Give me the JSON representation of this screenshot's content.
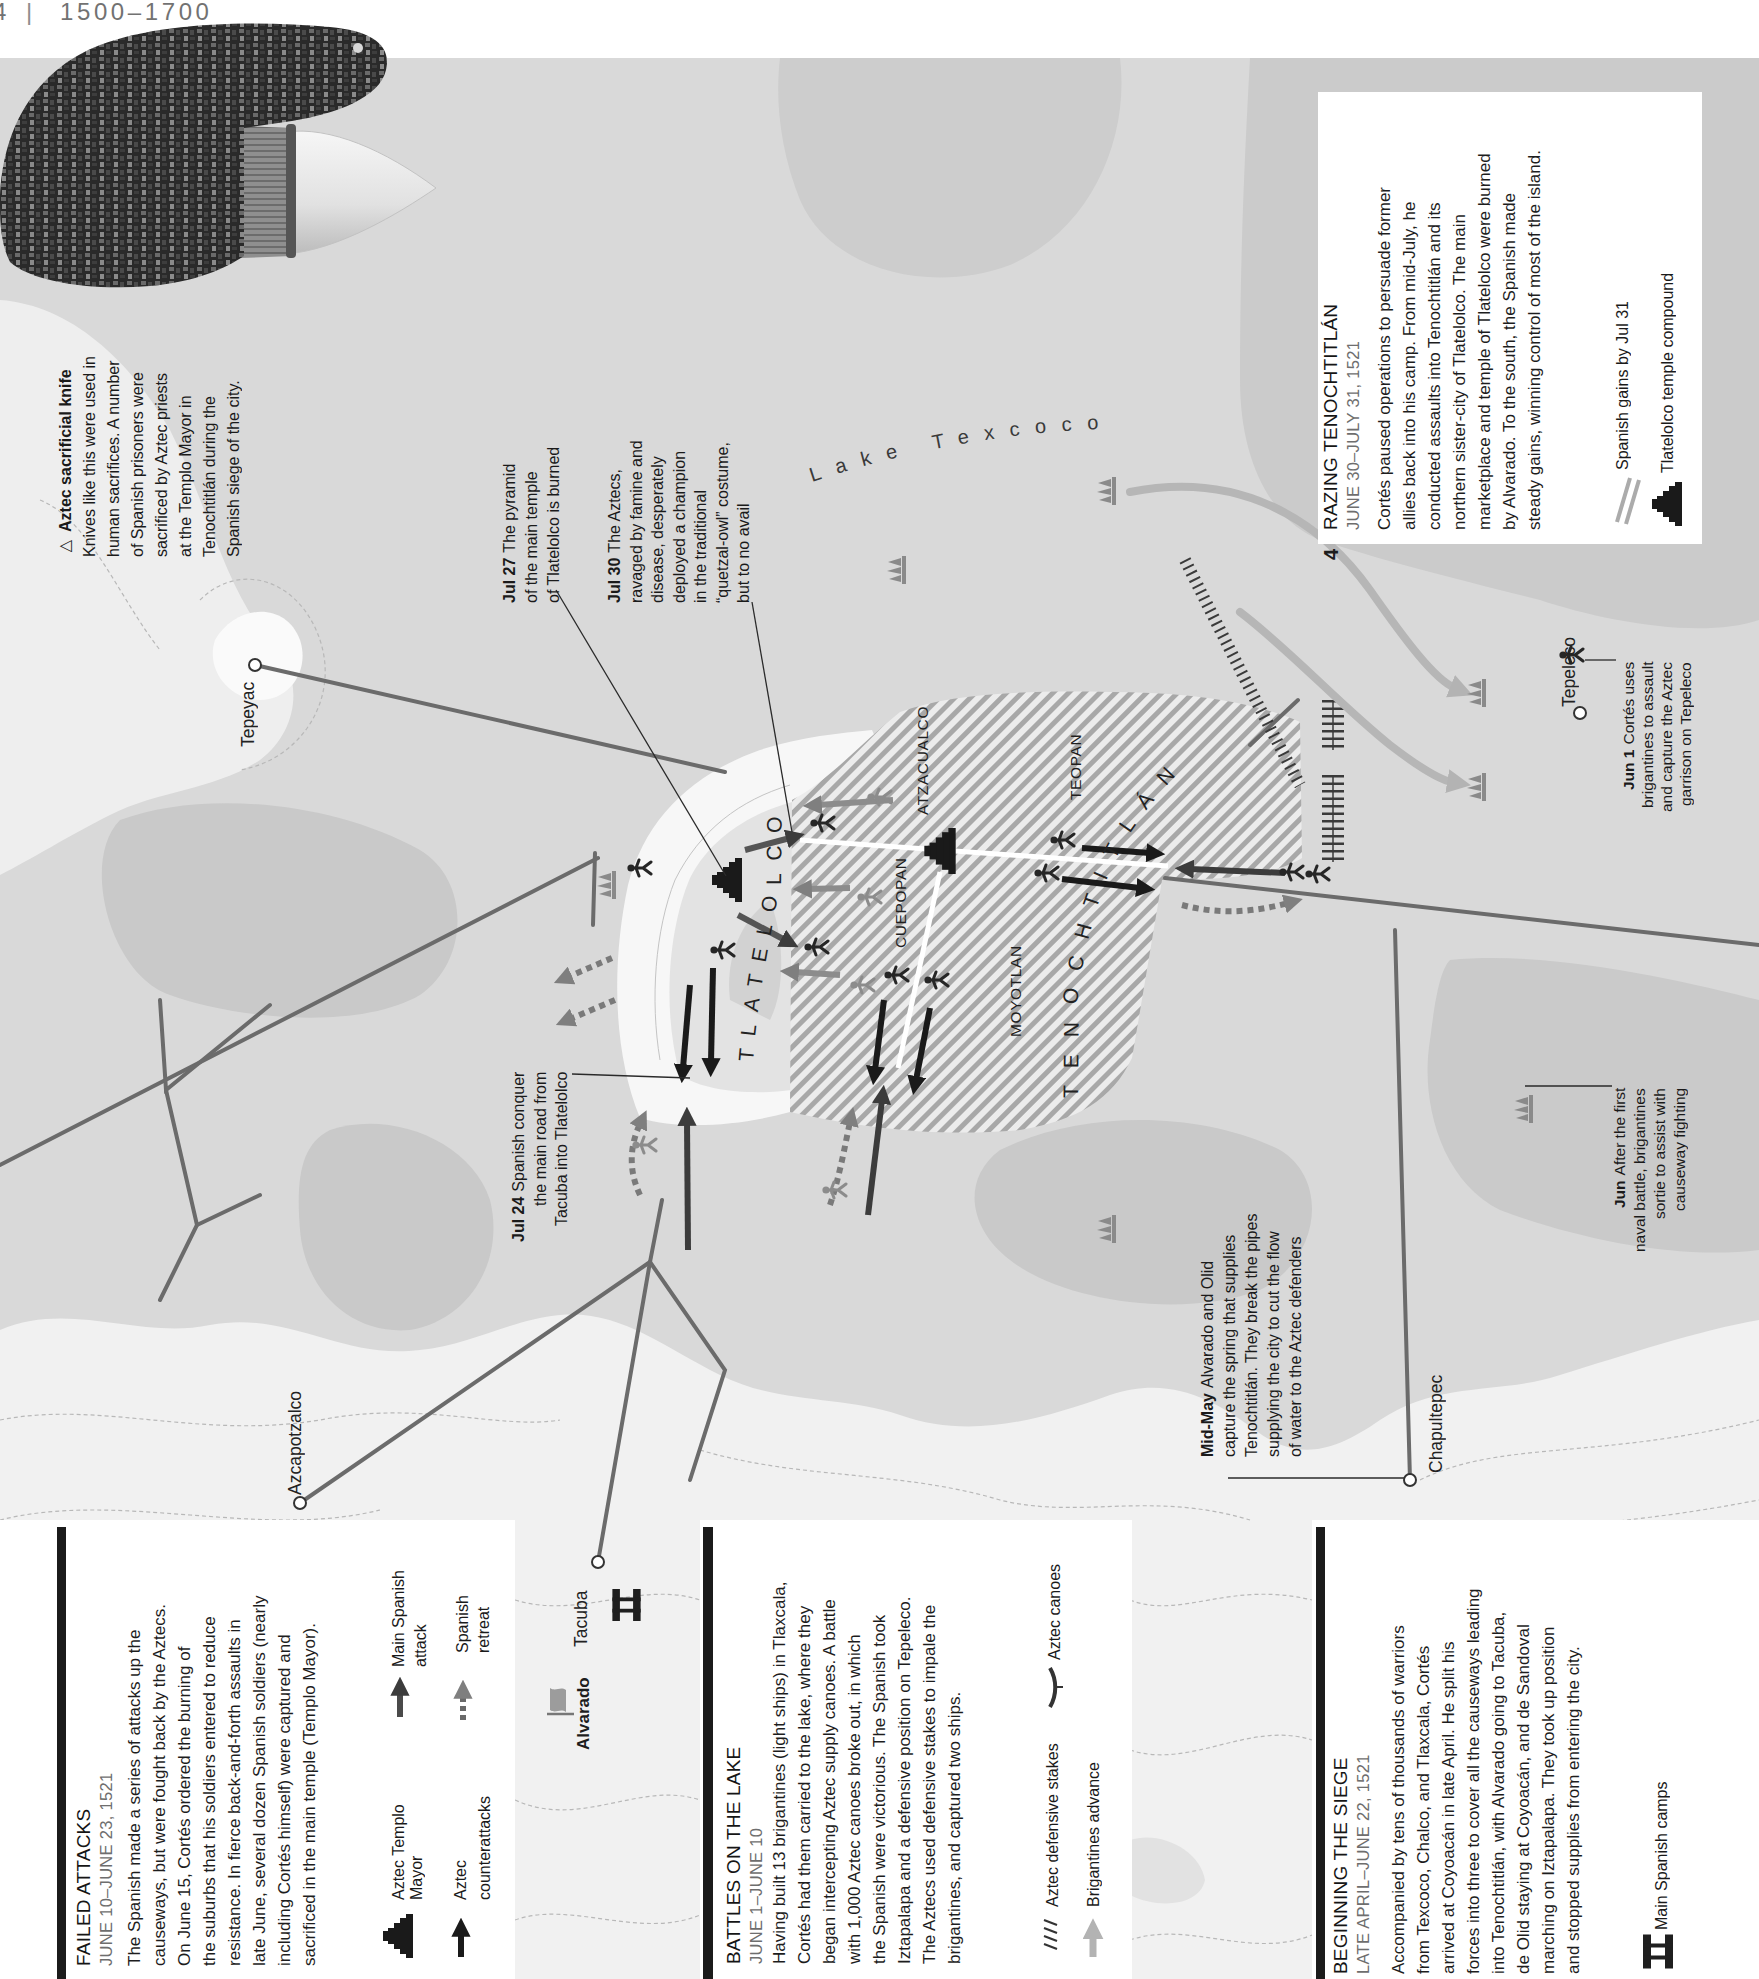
{
  "page_header": {
    "page_number": "4",
    "separator": "|",
    "period": "1500–1700"
  },
  "artifact": {
    "marker": "▷",
    "title": "Aztec sacrificial knife",
    "lines": [
      "Knives like this were used in",
      "human sacrifices. A number",
      "of Spanish prisoners were",
      "sacrificed by Aztec priests",
      "at the Templo Mayor in",
      "Tenochtitlán during the",
      "Spanish siege of the city."
    ]
  },
  "map": {
    "lake_label": "Lake Texcoco",
    "cities": {
      "tlatelolco": "TLATELOLCO",
      "tenochtitlan": "TENOCHTITLÁN"
    },
    "districts": {
      "atzacualco": "ATZACUALCO",
      "teopan": "TEOPAN",
      "cuepopan": "CUEPOPAN",
      "moyotlan": "MOYOTLAN"
    },
    "places": {
      "tepeyac": "Tepeyac",
      "azcapotzalco": "Azcapotzalco",
      "tacuba": "Tacuba",
      "chapultepec": "Chapultepec",
      "tepeleco": "Tepeleco"
    },
    "commander": "Alvarado",
    "annotations": {
      "jul27": {
        "date": "Jul 27",
        "lines": [
          "The pyramid",
          "of the main temple",
          "of Tlatelolco is burned"
        ]
      },
      "jul30": {
        "date": "Jul 30",
        "lines": [
          "The Aztecs,",
          "ravaged by famine and",
          "disease, desperately",
          "deployed a champion",
          "in the traditional",
          "“quetzal-owl” costume,",
          "but to no avail"
        ]
      },
      "jul24": {
        "date": "Jul 24",
        "lines": [
          "Spanish conquer",
          "the main road from",
          "Tacuba into Tlatelolco"
        ]
      },
      "midmay": {
        "date": "Mid-May",
        "lines": [
          "Alvarado and Olid",
          "capture the spring that supplies",
          "Tenochtitlán. They break the pipes",
          "supplying the city to cut the flow",
          "of water to the Aztec defenders"
        ]
      },
      "jun1": {
        "date": "Jun 1",
        "lines": [
          "Cortés uses",
          "brigantines to assault",
          "and capture the Aztec",
          "garrison on Tepeleco"
        ]
      },
      "jun": {
        "date": "Jun",
        "lines": [
          "After the first",
          "naval battle, brigantines",
          "sortie to assist with",
          "causeway fighting"
        ]
      }
    }
  },
  "sections": {
    "failed_attacks": {
      "title": "FAILED ATTACKS",
      "dates": "JUNE 10–JUNE 23, 1521",
      "body": [
        "The Spanish made a series of attacks up the",
        "causeways, but were fought back by the Aztecs.",
        "On June 15, Cortés ordered the burning of",
        "the suburbs that his soldiers entered to reduce",
        "resistance. In fierce back-and-forth assaults in",
        "late June, several dozen Spanish soldiers (nearly",
        "including Cortés himself) were captured and",
        "sacrificed in the main temple (Templo Mayor)."
      ],
      "legend": {
        "templo_mayor": [
          "Aztec Templo",
          "Mayor"
        ],
        "main_attack": [
          "Main Spanish",
          "attack"
        ],
        "counterattacks": [
          "Aztec",
          "counterattacks"
        ],
        "retreat": [
          "Spanish",
          "retreat"
        ]
      }
    },
    "battles_on_lake": {
      "title": "BATTLES ON THE LAKE",
      "dates": "JUNE 1–JUNE 10",
      "body": [
        "Having built 13 brigantines (light ships) in Tlaxcala,",
        "Cortés had them carried to the lake, where they",
        "began intercepting Aztec supply canoes. A battle",
        "with 1,000 Aztec canoes broke out, in which",
        "the Spanish were victorious. The Spanish took",
        "Iztapalapa and a defensive position on Tepeleco.",
        "The Aztecs used defensive stakes to impale the",
        "brigantines, and captured two ships."
      ],
      "legend": {
        "stakes": "Aztec defensive stakes",
        "canoes": "Aztec canoes",
        "brigantines": "Brigantines advance"
      }
    },
    "beginning_siege": {
      "title": "BEGINNING THE SIEGE",
      "dates": "LATE APRIL–JUNE 22, 1521",
      "body": [
        "Accompanied by tens of thousands of warriors",
        "from Texcoco, Chalco, and Tlaxcala, Cortés",
        "arrived at Coyoacán in late April. He split his",
        "forces into three to cover all the causeways leading",
        "into Tenochtitlán, with Alvarado going to Tacuba,",
        "de Olid staying at Coyoacán, and de Sandoval",
        "marching on Iztapalapa. They took up position",
        "and stopped supplies from entering the city."
      ],
      "legend": {
        "camps": "Main Spanish camps"
      }
    },
    "razing": {
      "number": "4",
      "title": "RAZING TENOCHTITLÁN",
      "dates": "JUNE 30–JULY 31, 1521",
      "body": [
        "Cortés paused operations to persuade former",
        "allies back into his camp. From mid-July, he",
        "conducted assaults into Tenochtitlán and its",
        "northern sister-city of Tlatelolco. The main",
        "marketplace and temple of Tlatelolco were burned",
        "by Alvarado. To the south, the Spanish made",
        "steady gains, winning control of most of the island."
      ],
      "legend": {
        "gains": "Spanish gains by Jul 31",
        "temple": "Tlatelolco temple compound"
      }
    }
  },
  "colors": {
    "lake": "#d9d9d9",
    "deep_water": "#c9c9c9",
    "land": "#f1f1f1",
    "spanish_gains_hatch": "#a8a8a8",
    "causeway": "#6b6b6b",
    "aztec_counterattack": "#1a1a1a",
    "spanish_attack": "#3c3c3c",
    "brigantine_route": "#b6b6b6",
    "date_text": "#6e6e6e"
  }
}
